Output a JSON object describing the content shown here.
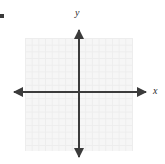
{
  "figure": {
    "name": "cartesian-coordinate-plane",
    "type": "blank-grid-graph",
    "background_color": "#ffffff",
    "grid": {
      "fill_color": "#f6f6f6",
      "line_color": "#ededed",
      "cell_size_px": 6.7,
      "columns": 16,
      "rows": 17,
      "left_px": 25,
      "top_px": 38,
      "width_px": 108,
      "height_px": 113
    },
    "axes": {
      "color": "#3b3b3b",
      "stroke_width": 2,
      "origin_px": {
        "x": 79,
        "y": 92
      },
      "x_axis": {
        "start_px": 11,
        "end_px": 149,
        "arrowheads": "both"
      },
      "y_axis": {
        "start_px": 26,
        "end_px": 160,
        "arrowheads": "both"
      }
    },
    "labels": {
      "y_axis_label": "y",
      "x_axis_label": "x"
    },
    "marks": {
      "corner_square": "•"
    }
  },
  "chart_data": {
    "type": "scatter",
    "title": "",
    "subtitle": "",
    "xlabel": "x",
    "ylabel": "y",
    "series": [
      {
        "name": "",
        "x": [],
        "y": []
      }
    ],
    "xlim": [
      -8,
      8
    ],
    "ylim": [
      -8,
      9
    ],
    "xticks": [],
    "yticks": [],
    "grid": true,
    "legend": "none",
    "annotations": []
  }
}
